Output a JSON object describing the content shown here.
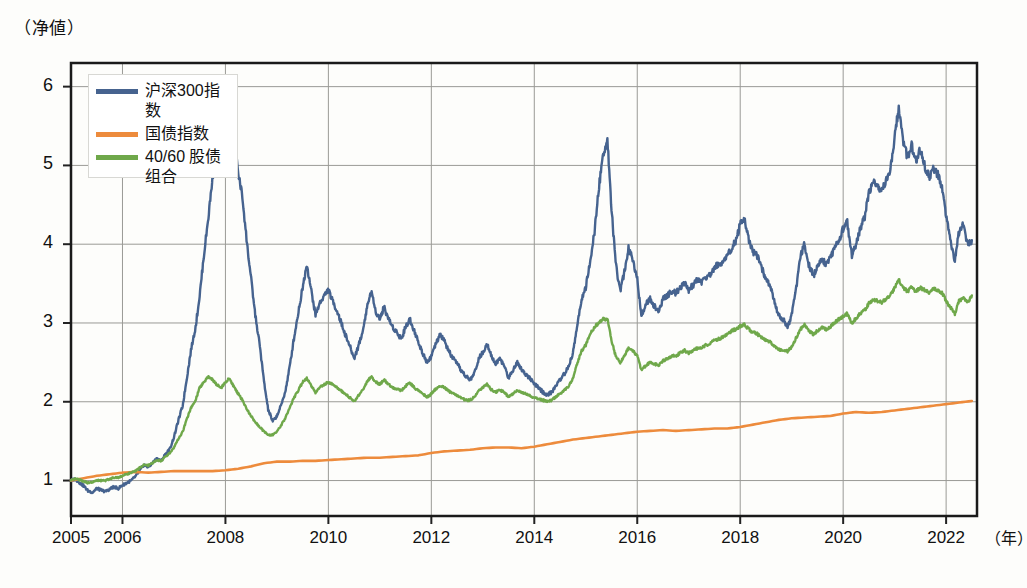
{
  "chart_data": {
    "type": "line",
    "title": "",
    "ylabel": "（净値）",
    "xlabel": "（年）",
    "grid": true,
    "legend_position": "top-left",
    "xlim": [
      2005,
      2022.6
    ],
    "ylim": [
      0.55,
      6.3
    ],
    "yticks": [
      "1",
      "2",
      "3",
      "4",
      "5",
      "6"
    ],
    "ytick_values": [
      1,
      2,
      3,
      4,
      5,
      6
    ],
    "xticks": [
      "2005",
      "2006",
      "2008",
      "2010",
      "2012",
      "2014",
      "2016",
      "2018",
      "2020",
      "2022"
    ],
    "xtick_values": [
      2005,
      2006,
      2008,
      2010,
      2012,
      2014,
      2016,
      2018,
      2020,
      2022
    ],
    "colors": {
      "csi300": "#46638f",
      "bond": "#ed8b3c",
      "blend": "#6fa84a"
    },
    "series": [
      {
        "name": "沪深300指数",
        "color": "#46638f",
        "x": [
          2005.0,
          2005.08,
          2005.17,
          2005.25,
          2005.33,
          2005.42,
          2005.5,
          2005.58,
          2005.67,
          2005.75,
          2005.83,
          2005.92,
          2006.0,
          2006.08,
          2006.17,
          2006.25,
          2006.33,
          2006.42,
          2006.5,
          2006.58,
          2006.67,
          2006.75,
          2006.83,
          2006.92,
          2007.0,
          2007.08,
          2007.17,
          2007.25,
          2007.33,
          2007.42,
          2007.5,
          2007.58,
          2007.67,
          2007.75,
          2007.83,
          2007.92,
          2008.0,
          2008.08,
          2008.17,
          2008.25,
          2008.33,
          2008.42,
          2008.5,
          2008.58,
          2008.67,
          2008.75,
          2008.83,
          2008.92,
          2009.0,
          2009.08,
          2009.17,
          2009.25,
          2009.33,
          2009.42,
          2009.5,
          2009.58,
          2009.67,
          2009.75,
          2009.83,
          2009.92,
          2010.0,
          2010.08,
          2010.17,
          2010.25,
          2010.33,
          2010.42,
          2010.5,
          2010.58,
          2010.67,
          2010.75,
          2010.83,
          2010.92,
          2011.0,
          2011.08,
          2011.17,
          2011.25,
          2011.33,
          2011.42,
          2011.5,
          2011.58,
          2011.67,
          2011.75,
          2011.83,
          2011.92,
          2012.0,
          2012.08,
          2012.17,
          2012.25,
          2012.33,
          2012.42,
          2012.5,
          2012.58,
          2012.67,
          2012.75,
          2012.83,
          2012.92,
          2013.0,
          2013.08,
          2013.17,
          2013.25,
          2013.33,
          2013.42,
          2013.5,
          2013.58,
          2013.67,
          2013.75,
          2013.83,
          2013.92,
          2014.0,
          2014.08,
          2014.17,
          2014.25,
          2014.33,
          2014.42,
          2014.5,
          2014.58,
          2014.67,
          2014.75,
          2014.83,
          2014.92,
          2015.0,
          2015.08,
          2015.17,
          2015.25,
          2015.33,
          2015.42,
          2015.5,
          2015.58,
          2015.67,
          2015.75,
          2015.83,
          2015.92,
          2016.0,
          2016.08,
          2016.17,
          2016.25,
          2016.33,
          2016.42,
          2016.5,
          2016.58,
          2016.67,
          2016.75,
          2016.83,
          2016.92,
          2017.0,
          2017.08,
          2017.17,
          2017.25,
          2017.33,
          2017.42,
          2017.5,
          2017.58,
          2017.67,
          2017.75,
          2017.83,
          2017.92,
          2018.0,
          2018.08,
          2018.17,
          2018.25,
          2018.33,
          2018.42,
          2018.5,
          2018.58,
          2018.67,
          2018.75,
          2018.83,
          2018.92,
          2019.0,
          2019.08,
          2019.17,
          2019.25,
          2019.33,
          2019.42,
          2019.5,
          2019.58,
          2019.67,
          2019.75,
          2019.83,
          2019.92,
          2020.0,
          2020.08,
          2020.17,
          2020.25,
          2020.33,
          2020.42,
          2020.5,
          2020.58,
          2020.67,
          2020.75,
          2020.83,
          2020.92,
          2021.0,
          2021.08,
          2021.17,
          2021.25,
          2021.33,
          2021.42,
          2021.5,
          2021.58,
          2021.67,
          2021.75,
          2021.83,
          2021.92,
          2022.0,
          2022.08,
          2022.17,
          2022.25,
          2022.33,
          2022.42,
          2022.5
        ],
        "y": [
          1.0,
          1.02,
          0.97,
          0.93,
          0.87,
          0.85,
          0.9,
          0.88,
          0.86,
          0.89,
          0.92,
          0.9,
          0.94,
          0.97,
          1.0,
          1.05,
          1.12,
          1.2,
          1.17,
          1.22,
          1.28,
          1.25,
          1.33,
          1.4,
          1.55,
          1.75,
          1.95,
          2.3,
          2.65,
          2.95,
          3.35,
          3.85,
          4.35,
          4.85,
          5.2,
          5.05,
          5.45,
          5.75,
          5.3,
          4.9,
          4.6,
          4.0,
          3.55,
          3.1,
          2.7,
          2.25,
          1.9,
          1.75,
          1.82,
          1.95,
          2.15,
          2.45,
          2.8,
          3.15,
          3.45,
          3.75,
          3.4,
          3.1,
          3.25,
          3.35,
          3.42,
          3.28,
          3.15,
          3.0,
          2.85,
          2.7,
          2.55,
          2.7,
          2.9,
          3.2,
          3.4,
          3.15,
          3.05,
          3.2,
          3.05,
          2.95,
          2.88,
          2.8,
          2.95,
          3.05,
          2.9,
          2.75,
          2.62,
          2.5,
          2.58,
          2.72,
          2.85,
          2.78,
          2.65,
          2.55,
          2.48,
          2.4,
          2.32,
          2.28,
          2.35,
          2.55,
          2.62,
          2.75,
          2.58,
          2.48,
          2.55,
          2.45,
          2.3,
          2.4,
          2.5,
          2.42,
          2.35,
          2.3,
          2.22,
          2.18,
          2.12,
          2.08,
          2.12,
          2.2,
          2.28,
          2.35,
          2.45,
          2.62,
          2.95,
          3.3,
          3.45,
          3.75,
          4.15,
          4.7,
          5.1,
          5.35,
          4.45,
          3.75,
          3.4,
          3.65,
          3.95,
          3.8,
          3.55,
          3.1,
          3.25,
          3.3,
          3.22,
          3.15,
          3.3,
          3.35,
          3.4,
          3.38,
          3.45,
          3.5,
          3.42,
          3.48,
          3.55,
          3.52,
          3.58,
          3.62,
          3.7,
          3.75,
          3.78,
          3.85,
          3.95,
          4.05,
          4.25,
          4.32,
          4.05,
          3.9,
          3.85,
          3.7,
          3.55,
          3.48,
          3.25,
          3.1,
          3.05,
          2.95,
          3.1,
          3.4,
          3.85,
          4.0,
          3.75,
          3.6,
          3.7,
          3.8,
          3.75,
          3.82,
          3.95,
          4.05,
          4.2,
          4.28,
          3.85,
          4.0,
          4.2,
          4.35,
          4.65,
          4.8,
          4.72,
          4.68,
          4.8,
          4.95,
          5.35,
          5.75,
          5.3,
          5.1,
          5.25,
          5.05,
          5.2,
          5.0,
          4.85,
          4.95,
          4.9,
          4.7,
          4.35,
          4.05,
          3.8,
          4.15,
          4.25,
          4.0,
          4.05
        ]
      },
      {
        "name": "国债指数",
        "color": "#ed8b3c",
        "x": [
          2005.0,
          2005.25,
          2005.5,
          2005.75,
          2006.0,
          2006.25,
          2006.5,
          2006.75,
          2007.0,
          2007.25,
          2007.5,
          2007.75,
          2008.0,
          2008.25,
          2008.5,
          2008.75,
          2009.0,
          2009.25,
          2009.5,
          2009.75,
          2010.0,
          2010.25,
          2010.5,
          2010.75,
          2011.0,
          2011.25,
          2011.5,
          2011.75,
          2012.0,
          2012.25,
          2012.5,
          2012.75,
          2013.0,
          2013.25,
          2013.5,
          2013.75,
          2014.0,
          2014.25,
          2014.5,
          2014.75,
          2015.0,
          2015.25,
          2015.5,
          2015.75,
          2016.0,
          2016.25,
          2016.5,
          2016.75,
          2017.0,
          2017.25,
          2017.5,
          2017.75,
          2018.0,
          2018.25,
          2018.5,
          2018.75,
          2019.0,
          2019.25,
          2019.5,
          2019.75,
          2020.0,
          2020.25,
          2020.5,
          2020.75,
          2021.0,
          2021.25,
          2021.5,
          2021.75,
          2022.0,
          2022.25,
          2022.5
        ],
        "y": [
          1.0,
          1.03,
          1.06,
          1.08,
          1.1,
          1.11,
          1.1,
          1.11,
          1.12,
          1.12,
          1.12,
          1.12,
          1.13,
          1.15,
          1.18,
          1.22,
          1.24,
          1.24,
          1.25,
          1.25,
          1.26,
          1.27,
          1.28,
          1.29,
          1.29,
          1.3,
          1.31,
          1.32,
          1.35,
          1.37,
          1.38,
          1.39,
          1.41,
          1.42,
          1.42,
          1.41,
          1.43,
          1.46,
          1.49,
          1.52,
          1.54,
          1.56,
          1.58,
          1.6,
          1.62,
          1.63,
          1.64,
          1.63,
          1.64,
          1.65,
          1.66,
          1.66,
          1.68,
          1.71,
          1.74,
          1.77,
          1.79,
          1.8,
          1.81,
          1.82,
          1.85,
          1.87,
          1.86,
          1.87,
          1.89,
          1.91,
          1.93,
          1.95,
          1.97,
          1.99,
          2.01
        ]
      },
      {
        "name": "40/60 股债组合",
        "color": "#6fa84a",
        "x": [
          2005.0,
          2005.08,
          2005.17,
          2005.25,
          2005.33,
          2005.42,
          2005.5,
          2005.58,
          2005.67,
          2005.75,
          2005.83,
          2005.92,
          2006.0,
          2006.08,
          2006.17,
          2006.25,
          2006.33,
          2006.42,
          2006.5,
          2006.58,
          2006.67,
          2006.75,
          2006.83,
          2006.92,
          2007.0,
          2007.08,
          2007.17,
          2007.25,
          2007.33,
          2007.42,
          2007.5,
          2007.58,
          2007.67,
          2007.75,
          2007.83,
          2007.92,
          2008.0,
          2008.08,
          2008.17,
          2008.25,
          2008.33,
          2008.42,
          2008.5,
          2008.58,
          2008.67,
          2008.75,
          2008.83,
          2008.92,
          2009.0,
          2009.08,
          2009.17,
          2009.25,
          2009.33,
          2009.42,
          2009.5,
          2009.58,
          2009.67,
          2009.75,
          2009.83,
          2009.92,
          2010.0,
          2010.08,
          2010.17,
          2010.25,
          2010.33,
          2010.42,
          2010.5,
          2010.58,
          2010.67,
          2010.75,
          2010.83,
          2010.92,
          2011.0,
          2011.08,
          2011.17,
          2011.25,
          2011.33,
          2011.42,
          2011.5,
          2011.58,
          2011.67,
          2011.75,
          2011.83,
          2011.92,
          2012.0,
          2012.08,
          2012.17,
          2012.25,
          2012.33,
          2012.42,
          2012.5,
          2012.58,
          2012.67,
          2012.75,
          2012.83,
          2012.92,
          2013.0,
          2013.08,
          2013.17,
          2013.25,
          2013.33,
          2013.42,
          2013.5,
          2013.58,
          2013.67,
          2013.75,
          2013.83,
          2013.92,
          2014.0,
          2014.08,
          2014.17,
          2014.25,
          2014.33,
          2014.42,
          2014.5,
          2014.58,
          2014.67,
          2014.75,
          2014.83,
          2014.92,
          2015.0,
          2015.08,
          2015.17,
          2015.25,
          2015.33,
          2015.42,
          2015.5,
          2015.58,
          2015.67,
          2015.75,
          2015.83,
          2015.92,
          2016.0,
          2016.08,
          2016.17,
          2016.25,
          2016.33,
          2016.42,
          2016.5,
          2016.58,
          2016.67,
          2016.75,
          2016.83,
          2016.92,
          2017.0,
          2017.08,
          2017.17,
          2017.25,
          2017.33,
          2017.42,
          2017.5,
          2017.58,
          2017.67,
          2017.75,
          2017.83,
          2017.92,
          2018.0,
          2018.08,
          2018.17,
          2018.25,
          2018.33,
          2018.42,
          2018.5,
          2018.58,
          2018.67,
          2018.75,
          2018.83,
          2018.92,
          2019.0,
          2019.08,
          2019.17,
          2019.25,
          2019.33,
          2019.42,
          2019.5,
          2019.58,
          2019.67,
          2019.75,
          2019.83,
          2019.92,
          2020.0,
          2020.08,
          2020.17,
          2020.25,
          2020.33,
          2020.42,
          2020.5,
          2020.58,
          2020.67,
          2020.75,
          2020.83,
          2020.92,
          2021.0,
          2021.08,
          2021.17,
          2021.25,
          2021.33,
          2021.42,
          2021.5,
          2021.58,
          2021.67,
          2021.75,
          2021.83,
          2021.92,
          2022.0,
          2022.08,
          2022.17,
          2022.25,
          2022.33,
          2022.42,
          2022.5
        ],
        "y": [
          1.0,
          1.02,
          1.01,
          0.99,
          0.97,
          0.98,
          1.0,
          1.0,
          1.0,
          1.02,
          1.04,
          1.04,
          1.06,
          1.08,
          1.1,
          1.12,
          1.16,
          1.2,
          1.19,
          1.22,
          1.26,
          1.25,
          1.3,
          1.35,
          1.42,
          1.52,
          1.62,
          1.78,
          1.92,
          2.02,
          2.18,
          2.25,
          2.32,
          2.28,
          2.22,
          2.18,
          2.25,
          2.3,
          2.18,
          2.1,
          2.02,
          1.9,
          1.82,
          1.74,
          1.68,
          1.62,
          1.58,
          1.58,
          1.62,
          1.7,
          1.8,
          1.92,
          2.05,
          2.15,
          2.25,
          2.3,
          2.2,
          2.12,
          2.18,
          2.22,
          2.25,
          2.22,
          2.18,
          2.14,
          2.1,
          2.05,
          2.0,
          2.08,
          2.15,
          2.25,
          2.32,
          2.25,
          2.22,
          2.28,
          2.22,
          2.18,
          2.16,
          2.14,
          2.2,
          2.24,
          2.18,
          2.14,
          2.1,
          2.06,
          2.1,
          2.16,
          2.2,
          2.18,
          2.14,
          2.1,
          2.08,
          2.05,
          2.02,
          2.02,
          2.06,
          2.14,
          2.18,
          2.22,
          2.15,
          2.12,
          2.15,
          2.12,
          2.06,
          2.1,
          2.14,
          2.12,
          2.1,
          2.08,
          2.05,
          2.04,
          2.02,
          2.0,
          2.02,
          2.06,
          2.1,
          2.14,
          2.2,
          2.3,
          2.48,
          2.65,
          2.72,
          2.85,
          2.95,
          3.0,
          3.05,
          3.05,
          2.78,
          2.58,
          2.5,
          2.58,
          2.68,
          2.65,
          2.58,
          2.4,
          2.46,
          2.5,
          2.48,
          2.46,
          2.52,
          2.55,
          2.58,
          2.58,
          2.62,
          2.65,
          2.62,
          2.65,
          2.68,
          2.68,
          2.72,
          2.74,
          2.78,
          2.8,
          2.82,
          2.85,
          2.9,
          2.92,
          2.96,
          2.98,
          2.92,
          2.88,
          2.86,
          2.82,
          2.78,
          2.76,
          2.7,
          2.66,
          2.65,
          2.64,
          2.7,
          2.8,
          2.92,
          2.98,
          2.9,
          2.86,
          2.9,
          2.94,
          2.92,
          2.95,
          3.0,
          3.05,
          3.08,
          3.12,
          3.0,
          3.06,
          3.12,
          3.16,
          3.25,
          3.3,
          3.28,
          3.26,
          3.3,
          3.35,
          3.45,
          3.55,
          3.45,
          3.4,
          3.45,
          3.4,
          3.45,
          3.42,
          3.38,
          3.44,
          3.42,
          3.38,
          3.28,
          3.2,
          3.12,
          3.28,
          3.32,
          3.26,
          3.35
        ]
      }
    ]
  },
  "legend": {
    "items": [
      {
        "label": "沪深300指数"
      },
      {
        "label": "国债指数"
      },
      {
        "label": "40/60 股债"
      },
      {
        "label": "组合"
      }
    ]
  }
}
